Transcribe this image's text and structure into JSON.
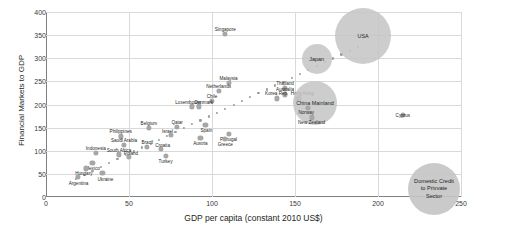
{
  "chart_data": {
    "type": "scatter",
    "title": "",
    "xlabel": "GDP per capita (constant 2010 US$)",
    "ylabel": "Financial Markets to GDP",
    "xlim": [
      0,
      250
    ],
    "ylim": [
      0,
      400
    ],
    "xticks": [
      0,
      50,
      100,
      150,
      200,
      250
    ],
    "yticks": [
      0,
      50,
      100,
      150,
      200,
      250,
      300,
      350,
      400
    ],
    "grid": true,
    "legend": {
      "position": "bottom-right",
      "size_encoding_label": "Domestic Credit to Privvate Sector"
    },
    "series": [
      {
        "name": "Countries",
        "points": [
          {
            "label": "Singapore",
            "x": 108,
            "y": 352,
            "size": 5,
            "label_dx": 0,
            "label_dy": -5
          },
          {
            "label": "USA",
            "x": 191,
            "y": 348,
            "size": 28,
            "label_dx": 0,
            "label_dy": 0
          },
          {
            "label": "Japan",
            "x": 163,
            "y": 298,
            "size": 15,
            "label_dx": 0,
            "label_dy": 0
          },
          {
            "label": "Malaysia",
            "x": 110,
            "y": 247,
            "size": 5,
            "label_dx": 0,
            "label_dy": -5
          },
          {
            "label": "Netherlands",
            "x": 104,
            "y": 230,
            "size": 5,
            "label_dx": 0,
            "label_dy": -5
          },
          {
            "label": "Thailand",
            "x": 144,
            "y": 235,
            "size": 5,
            "label_dx": 0,
            "label_dy": -5
          },
          {
            "label": "Australia",
            "x": 144,
            "y": 222,
            "size": 5,
            "label_dx": 0,
            "label_dy": -5
          },
          {
            "label": "Korea Rep.",
            "x": 139,
            "y": 213,
            "size": 5,
            "label_dx": 0,
            "label_dy": -5
          },
          {
            "label": "Hong Kong",
            "x": 152,
            "y": 213,
            "size": 5,
            "label_dx": 4,
            "label_dy": -5
          },
          {
            "label": "China Mainland",
            "x": 162,
            "y": 203,
            "size": 22,
            "label_dx": 0,
            "label_dy": 0
          },
          {
            "label": "Norway",
            "x": 158,
            "y": 192,
            "size": 5,
            "label_dx": -2,
            "label_dy": 4
          },
          {
            "label": "New Zealand",
            "x": 160,
            "y": 172,
            "size": 5,
            "label_dx": 0,
            "label_dy": 5
          },
          {
            "label": "Cyprus",
            "x": 215,
            "y": 177,
            "size": 5,
            "label_dx": 0,
            "label_dy": 0
          },
          {
            "label": "Chile",
            "x": 100,
            "y": 207,
            "size": 5,
            "label_dx": 0,
            "label_dy": -5
          },
          {
            "label": "Luxembourg",
            "x": 88,
            "y": 196,
            "size": 5,
            "label_dx": -4,
            "label_dy": -4
          },
          {
            "label": "Denmark",
            "x": 92,
            "y": 196,
            "size": 5,
            "label_dx": 5,
            "label_dy": -4
          },
          {
            "label": "Spain",
            "x": 96,
            "y": 156,
            "size": 5,
            "label_dx": 1,
            "label_dy": 5
          },
          {
            "label": "Qatar",
            "x": 79,
            "y": 152,
            "size": 5,
            "label_dx": 0,
            "label_dy": -5
          },
          {
            "label": "Belgium",
            "x": 62,
            "y": 150,
            "size": 5,
            "label_dx": 0,
            "label_dy": -5
          },
          {
            "label": "Israel",
            "x": 75,
            "y": 135,
            "size": 5,
            "label_dx": -3,
            "label_dy": -4
          },
          {
            "label": "Portugal",
            "x": 110,
            "y": 137,
            "size": 5,
            "label_dx": 0,
            "label_dy": 5
          },
          {
            "label": "Greece",
            "x": 108,
            "y": 126,
            "size": 5,
            "label_dx": 0,
            "label_dy": 5
          },
          {
            "label": "Austria",
            "x": 93,
            "y": 128,
            "size": 5,
            "label_dx": 0,
            "label_dy": 5
          },
          {
            "label": "Philippines",
            "x": 45,
            "y": 131,
            "size": 5,
            "label_dx": 0,
            "label_dy": -5
          },
          {
            "label": "Saudi Arabia",
            "x": 47,
            "y": 113,
            "size": 5,
            "label_dx": 0,
            "label_dy": -5
          },
          {
            "label": "Brazil",
            "x": 61,
            "y": 108,
            "size": 5,
            "label_dx": 0,
            "label_dy": -5
          },
          {
            "label": "Croatia",
            "x": 69,
            "y": 104,
            "size": 5,
            "label_dx": 2,
            "label_dy": -4
          },
          {
            "label": "Turkey",
            "x": 72,
            "y": 88,
            "size": 5,
            "label_dx": 0,
            "label_dy": 5
          },
          {
            "label": "Indonesia",
            "x": 30,
            "y": 96,
            "size": 5,
            "label_dx": 0,
            "label_dy": -5
          },
          {
            "label": "South Africa",
            "x": 44,
            "y": 92,
            "size": 5,
            "label_dx": 0,
            "label_dy": -4
          },
          {
            "label": "Poland",
            "x": 50,
            "y": 86,
            "size": 5,
            "label_dx": 2,
            "label_dy": -4
          },
          {
            "label": "Mexico",
            "x": 28,
            "y": 74,
            "size": 5,
            "label_dx": 0,
            "label_dy": 5
          },
          {
            "label": "Hungary",
            "x": 24,
            "y": 62,
            "size": 5,
            "label_dx": -2,
            "label_dy": 5
          },
          {
            "label": "Ukraine",
            "x": 34,
            "y": 52,
            "size": 5,
            "label_dx": 3,
            "label_dy": 6
          },
          {
            "label": "Argentina",
            "x": 19,
            "y": 44,
            "size": 5,
            "label_dx": 1,
            "label_dy": 6
          }
        ]
      }
    ],
    "trendline": {
      "style": "dotted",
      "x_start": 18,
      "y_start": 40,
      "x_end": 188,
      "y_end": 325
    }
  }
}
